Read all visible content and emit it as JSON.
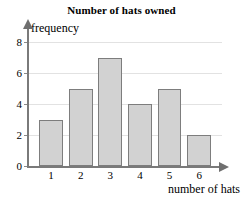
{
  "chart_data": {
    "type": "bar",
    "title": "Number of hats owned",
    "xlabel": "number of hats",
    "ylabel": "frequency",
    "categories": [
      "1",
      "2",
      "3",
      "4",
      "5",
      "6"
    ],
    "values": [
      3,
      5,
      7,
      4,
      5,
      2
    ],
    "ylim": [
      0,
      8
    ],
    "ytick_labels": [
      "0",
      "2",
      "4",
      "6",
      "8"
    ],
    "ytick_values": [
      0,
      2,
      4,
      6,
      8
    ],
    "grid": true,
    "legend": "none",
    "colors": {
      "bar_fill": "#d2d2d2",
      "bar_stroke": "#7d7d7d",
      "gridline": "#e2e2e2",
      "axis": "#7a7a7a",
      "text": "#000000",
      "background": "#ffffff"
    }
  }
}
